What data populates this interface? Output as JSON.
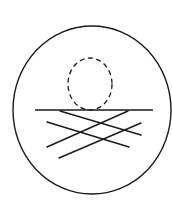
{
  "diagram": {
    "stroke_color": "#1a1a1a",
    "background": "#ffffff",
    "outer_ellipse": {
      "cx": 92,
      "cy": 110,
      "rx": 79,
      "ry": 84,
      "stroke_width": 1.4
    },
    "sun": {
      "cx": 90,
      "cy": 84,
      "rx": 22,
      "ry": 26,
      "stroke_width": 1.3,
      "dash": "5 3.5"
    },
    "horizon": {
      "x1": 35,
      "y1": 110,
      "x2": 153,
      "y2": 110,
      "stroke_width": 1.4
    },
    "reflection_lines": [
      {
        "x1": 60,
        "y1": 111,
        "x2": 141,
        "y2": 135
      },
      {
        "x1": 128,
        "y1": 111,
        "x2": 47,
        "y2": 147
      },
      {
        "x1": 47,
        "y1": 122,
        "x2": 129,
        "y2": 147
      },
      {
        "x1": 141,
        "y1": 123,
        "x2": 59,
        "y2": 158
      }
    ],
    "reflection_stroke_width": 1.4
  }
}
